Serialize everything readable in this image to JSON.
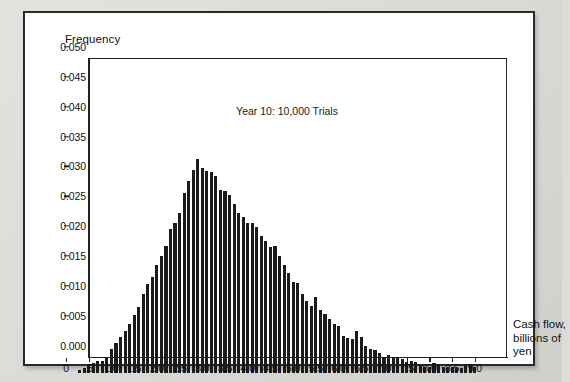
{
  "figure": {
    "annotation": "Year 10: 10,000 Trials",
    "y_axis_title": "Frequency",
    "x_axis_caption_lines": [
      "Cash flow,",
      "billions of",
      "yen"
    ],
    "bar_color": "#1b1b1b",
    "panel_background": "#ffffff",
    "page_background": "#dcdcd8"
  },
  "chart_data": {
    "type": "bar",
    "title": "",
    "subtitle": "",
    "annotations": [
      "Year 10: 10,000 Trials"
    ],
    "xlabel": "Cash flow, billions of yen",
    "ylabel": "Frequency",
    "xlim": [
      0,
      9.2
    ],
    "ylim": [
      0.0,
      0.05
    ],
    "grid": false,
    "legend": null,
    "bin_width": 0.1,
    "x_tick_labels": [
      "0",
      ".5",
      "1.0",
      "1.5",
      "2.0",
      "2.5",
      "3.0",
      "3.5",
      "4.0",
      "4.5",
      "5.0",
      "5.5",
      "6.0",
      "6.5",
      "7.0",
      "7.5",
      "8.0",
      "8.5",
      "9.0"
    ],
    "x_tick_values": [
      0,
      0.5,
      1.0,
      1.5,
      2.0,
      2.5,
      3.0,
      3.5,
      4.0,
      4.5,
      5.0,
      5.5,
      6.0,
      6.5,
      7.0,
      7.5,
      8.0,
      8.5,
      9.0
    ],
    "y_tick_labels": [
      "0.000",
      "0.005",
      "0.010",
      "0.015",
      "0.020",
      "0.025",
      "0.030",
      "0.035",
      "0.040",
      "0.045",
      "0.050"
    ],
    "y_tick_values": [
      0.0,
      0.005,
      0.01,
      0.015,
      0.02,
      0.025,
      0.03,
      0.035,
      0.04,
      0.045,
      0.05
    ],
    "x": [
      0.3,
      0.4,
      0.5,
      0.6,
      0.7,
      0.8,
      0.9,
      1.0,
      1.1,
      1.2,
      1.3,
      1.4,
      1.5,
      1.6,
      1.7,
      1.8,
      1.9,
      2.0,
      2.1,
      2.2,
      2.3,
      2.4,
      2.5,
      2.6,
      2.7,
      2.8,
      2.9,
      3.0,
      3.1,
      3.2,
      3.3,
      3.4,
      3.5,
      3.6,
      3.7,
      3.8,
      3.9,
      4.0,
      4.1,
      4.2,
      4.3,
      4.4,
      4.5,
      4.6,
      4.7,
      4.8,
      4.9,
      5.0,
      5.1,
      5.2,
      5.3,
      5.4,
      5.5,
      5.6,
      5.7,
      5.8,
      5.9,
      6.0,
      6.1,
      6.2,
      6.3,
      6.4,
      6.5,
      6.6,
      6.7,
      6.8,
      6.9,
      7.0,
      7.1,
      7.2,
      7.3,
      7.4,
      7.5,
      7.6,
      7.7,
      7.8,
      7.9,
      8.0,
      8.1,
      8.2,
      8.3,
      8.4,
      8.5,
      8.6,
      8.7,
      8.8,
      8.9,
      9.0
    ],
    "values": [
      0.0005,
      0.0008,
      0.0012,
      0.0016,
      0.002,
      0.0019,
      0.0024,
      0.004,
      0.005,
      0.006,
      0.007,
      0.0082,
      0.0096,
      0.011,
      0.0132,
      0.0148,
      0.016,
      0.018,
      0.0196,
      0.0212,
      0.024,
      0.025,
      0.0268,
      0.03,
      0.032,
      0.034,
      0.0357,
      0.0342,
      0.0337,
      0.0336,
      0.033,
      0.0306,
      0.0304,
      0.0298,
      0.0282,
      0.0268,
      0.026,
      0.025,
      0.025,
      0.0244,
      0.0228,
      0.022,
      0.021,
      0.0212,
      0.0196,
      0.018,
      0.0166,
      0.0152,
      0.015,
      0.0132,
      0.012,
      0.0112,
      0.0126,
      0.0104,
      0.0098,
      0.009,
      0.0082,
      0.0078,
      0.0062,
      0.0058,
      0.0056,
      0.007,
      0.006,
      0.0044,
      0.004,
      0.0038,
      0.0032,
      0.0026,
      0.003,
      0.0026,
      0.0026,
      0.0022,
      0.0018,
      0.002,
      0.0018,
      0.0012,
      0.001,
      0.001,
      0.0016,
      0.0014,
      0.001,
      0.0008,
      0.001,
      0.0008,
      0.0008,
      0.0014,
      0.0012,
      0.001
    ]
  }
}
